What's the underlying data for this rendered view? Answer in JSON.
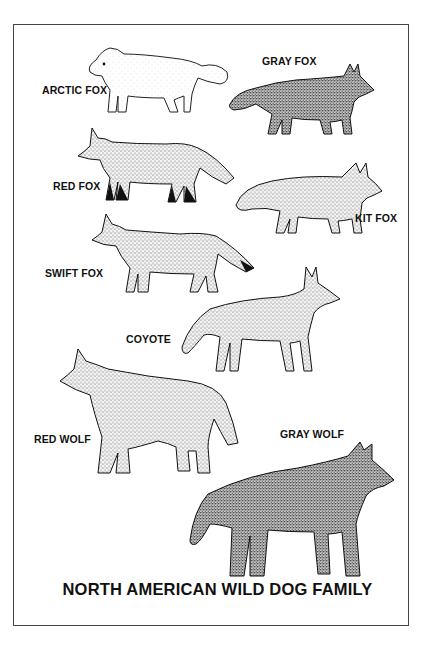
{
  "poster": {
    "title": "NORTH AMERICAN WILD DOG FAMILY",
    "background": "#ffffff",
    "ink": "#111111",
    "animals": [
      {
        "name": "ARCTIC FOX",
        "shade": "light"
      },
      {
        "name": "GRAY FOX",
        "shade": "dark"
      },
      {
        "name": "RED FOX",
        "shade": "medium"
      },
      {
        "name": "KIT FOX",
        "shade": "medium-light"
      },
      {
        "name": "SWIFT FOX",
        "shade": "medium-light"
      },
      {
        "name": "COYOTE",
        "shade": "medium"
      },
      {
        "name": "RED WOLF",
        "shade": "medium"
      },
      {
        "name": "GRAY WOLF",
        "shade": "dark"
      }
    ]
  }
}
